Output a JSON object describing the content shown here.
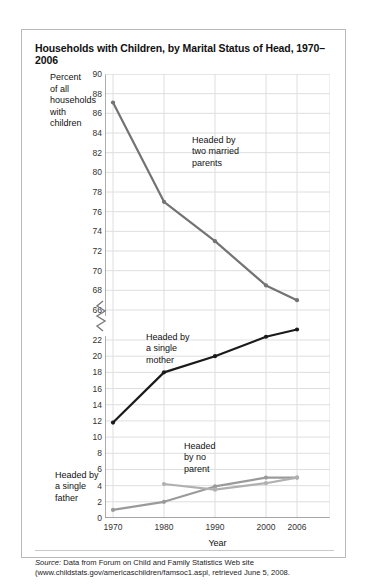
{
  "figure": {
    "title": "Households with Children, by Marital Status of Head, 1970–2006",
    "axis_title_y_lines": [
      "Percent",
      "of all",
      "households",
      "with",
      "children"
    ],
    "axis_title_x": "Year",
    "source_label": "Source:",
    "source_line1": " Data from Forum on Child and Family Statistics Web site",
    "source_line2": "(www.childstats.gov/americaschildren/famsoc1.aspl, retrieved June 5, 2008."
  },
  "annotations": {
    "married": "Headed by\ntwo married\nparents",
    "mother": "Headed by\na single\nmother",
    "no_parent": "Headed\nby no\nparent",
    "father": "Headed by\na single\nfather"
  },
  "colors": {
    "married_line": "#737373",
    "mother_line": "#1a1a1a",
    "father_line": "#9a9a9a",
    "no_parent_line": "#b0b0b0",
    "grid": "#dedede",
    "axis": "#8c8c8c",
    "frame": "#b9b9b9"
  },
  "chart_data": {
    "type": "line",
    "title": "Households with Children, by Marital Status of Head, 1970–2006",
    "xlabel": "Year",
    "ylabel": "Percent of all households with children",
    "x": [
      1970,
      1980,
      1990,
      2000,
      2006
    ],
    "x_tick_labels": [
      "1970",
      "1980",
      "1990",
      "2000",
      "2006"
    ],
    "y_ticks_upper": [
      66,
      68,
      70,
      72,
      74,
      76,
      78,
      80,
      82,
      84,
      86,
      88,
      90
    ],
    "y_ticks_lower": [
      0,
      2,
      4,
      6,
      8,
      10,
      12,
      14,
      16,
      18,
      20,
      22
    ],
    "axis_break": true,
    "axis_break_between": [
      22,
      66
    ],
    "grid": true,
    "legend_position": "inline-annotations",
    "series": [
      {
        "name": "Headed by two married parents",
        "color": "#737373",
        "x": [
          1970,
          1980,
          1990,
          2000,
          2006
        ],
        "values": [
          87.1,
          77.0,
          73.0,
          68.5,
          67.0
        ]
      },
      {
        "name": "Headed by a single mother",
        "color": "#1a1a1a",
        "x": [
          1970,
          1980,
          1990,
          2000,
          2006
        ],
        "values": [
          11.8,
          18.0,
          20.0,
          22.4,
          23.3
        ]
      },
      {
        "name": "Headed by a single father",
        "color": "#9a9a9a",
        "x": [
          1970,
          1980,
          1990,
          2000,
          2006
        ],
        "values": [
          1.0,
          2.0,
          3.9,
          5.0,
          5.0
        ]
      },
      {
        "name": "Headed by no parent",
        "color": "#b0b0b0",
        "x": [
          1980,
          1990,
          2000,
          2006
        ],
        "values": [
          4.2,
          3.5,
          4.3,
          5.0
        ]
      }
    ]
  }
}
